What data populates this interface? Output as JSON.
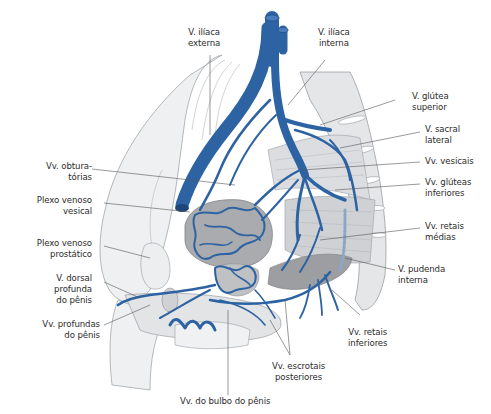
{
  "figure": {
    "type": "anatomical-illustration",
    "colors": {
      "vein": "#2e63a3",
      "vein_dark": "#1f4677",
      "bone": "#e4e6e8",
      "bone_outline": "#9a9ea3",
      "organ": "#a8aaad",
      "organ_dark": "#8c8e91",
      "muscle": "#c9cbcd",
      "leader_line": "#555555",
      "text": "#2b2b2b",
      "background": "#ffffff"
    }
  },
  "labels": {
    "v_iliaca_externa": "V. ilíaca\nexterna",
    "v_iliaca_interna": "V. ilíaca\ninterna",
    "v_glutea_superior": "V. glútea\nsuperior",
    "v_sacral_lateral": "V. sacral\nlateral",
    "vv_vesicais": "Vv. vesicais",
    "vv_gluteas_inferiores": "Vv. glúteas\ninferiores",
    "vv_retais_medias": "Vv. retais\nmédias",
    "v_pudenda_interna": "V. pudenda\ninterna",
    "vv_retais_inferiores": "Vv. retais\ninferiores",
    "vv_escrotais_posteriores": "Vv. escrotais\nposteriores",
    "vv_bulbo_penis": "Vv. do bulbo do pênis",
    "vv_profundas_penis": "Vv. profundas\ndo pênis",
    "v_dorsal_profunda_penis": "V. dorsal\nprofunda\ndo pênis",
    "plexo_venoso_prostatico": "Plexo venoso\nprostático",
    "plexo_venoso_vesical": "Plexo venoso\nvesical",
    "vv_obturatorias": "Vv. obtura-\ntórias"
  }
}
